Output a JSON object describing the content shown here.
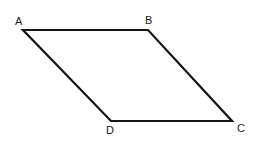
{
  "figure": {
    "name": "parallelogram-abcd",
    "background_color": "#ffffff",
    "stroke_color": "#141414",
    "stroke_width": 2.2,
    "canvas": {
      "width": 253,
      "height": 145
    },
    "vertices": [
      {
        "id": "A",
        "label": "A",
        "x": 23,
        "y": 30,
        "label_x": 15,
        "label_y": 16
      },
      {
        "id": "B",
        "label": "B",
        "x": 148,
        "y": 30,
        "label_x": 145,
        "label_y": 15
      },
      {
        "id": "C",
        "label": "C",
        "x": 232,
        "y": 121,
        "label_x": 237,
        "label_y": 123
      },
      {
        "id": "D",
        "label": "D",
        "x": 111,
        "y": 121,
        "label_x": 106,
        "label_y": 125
      }
    ],
    "edges": [
      {
        "id": "AB",
        "from": "A",
        "to": "B"
      },
      {
        "id": "BC",
        "from": "B",
        "to": "C"
      },
      {
        "id": "CD",
        "from": "C",
        "to": "D"
      },
      {
        "id": "DA",
        "from": "D",
        "to": "A"
      }
    ],
    "polygon_points": "23,30 148,30 232,121 111,121"
  }
}
